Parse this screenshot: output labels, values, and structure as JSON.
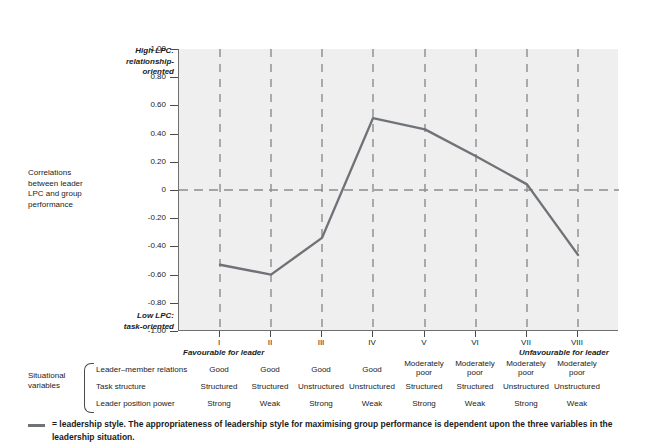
{
  "chart_data": {
    "type": "line",
    "title": "",
    "xlabel": "",
    "ylabel": "Correlations between leader LPC and group performance",
    "categories": [
      "I",
      "II",
      "III",
      "IV",
      "V",
      "VI",
      "VII",
      "VIII"
    ],
    "values": [
      -0.53,
      -0.6,
      -0.34,
      0.51,
      0.43,
      0.24,
      0.04,
      -0.46
    ],
    "series": [
      {
        "name": "leadership style",
        "values": [
          -0.53,
          -0.6,
          -0.34,
          0.51,
          0.43,
          0.24,
          0.04,
          -0.46
        ]
      }
    ],
    "ylim": [
      -1.0,
      1.0
    ],
    "ytick_labels": [
      "1.00",
      "0.80",
      "0.60",
      "0.40",
      "0.20",
      "0",
      "-0.20",
      "-0.40",
      "-0.60",
      "-0.80",
      "-1.00"
    ],
    "ytick_values": [
      1.0,
      0.8,
      0.6,
      0.4,
      0.2,
      0,
      -0.2,
      -0.4,
      -0.6,
      -0.8,
      -1.0
    ],
    "grid": "dashed vertical gridlines at each category, dashed horizontal gridline at y = 0",
    "legend_position": "below chart",
    "line_color": "#6f7276",
    "plot_background": "#efefef"
  },
  "axis": {
    "high_lpc_label": "High LPC:\nrelationship-\noriented",
    "correlations_label": "Correlations\nbetween leader\nLPC and group\nperformance",
    "low_lpc_label": "Low LPC:\ntask-oriented",
    "favourable_left": "Favourable for leader",
    "favourable_right": "Unfavourable for leader"
  },
  "situational": {
    "group_title": "Situational\nvariables",
    "rows": [
      {
        "label": "Leader–member relations",
        "cells": [
          "Good",
          "Good",
          "Good",
          "Good",
          "Moderately\npoor",
          "Moderately\npoor",
          "Moderately\npoor",
          "Moderately\npoor"
        ]
      },
      {
        "label": "Task structure",
        "cells": [
          "Structured",
          "Structured",
          "Unstructured",
          "Unstructured",
          "Structured",
          "Structured",
          "Unstructured",
          "Unstructured"
        ]
      },
      {
        "label": "Leader position power",
        "cells": [
          "Strong",
          "Weak",
          "Strong",
          "Weak",
          "Strong",
          "Weak",
          "Strong",
          "Weak"
        ]
      }
    ]
  },
  "caption": {
    "line1": "= leadership style.  The appropriateness of leadership style for maximising group performance is dependent upon the three variables in the",
    "line2": "leadership situation."
  }
}
